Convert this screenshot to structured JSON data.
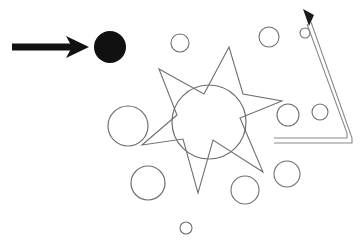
{
  "document": {
    "title": "Annotated Shapes Diagram",
    "background_color": "#ffffff",
    "width": 364,
    "height": 245
  },
  "palette": {
    "ink_black": "#111111",
    "outline_gray": "#6f6f6f",
    "outline_gray_light": "#8a8a8a",
    "background": "#ffffff"
  },
  "shapes": {
    "pointer_arrow": {
      "name": "straight-right-arrow",
      "color": "#111111",
      "shaft_start_x": 12,
      "shaft_end_x": 72,
      "shaft_y": 47,
      "shaft_thickness": 7,
      "head_tip_x": 89,
      "head_tip_y": 47,
      "head_back_x": 66,
      "head_half_height": 11
    },
    "filled_circle": {
      "name": "filled-black-circle",
      "cx": 110,
      "cy": 47,
      "r": 16,
      "fill": "#111111"
    },
    "star": {
      "name": "six-point-star-outline",
      "stroke": "#6f6f6f",
      "stroke_width": 1.1,
      "fill": "none",
      "points": "229,47 243,94 282,101 240,118 263,172 213,140 198,193 183,139 142,145 177,115 159,69 204,94"
    },
    "center_circle": {
      "name": "center-circle-outline",
      "cx": 209,
      "cy": 122,
      "r": 37,
      "stroke": "#6f6f6f",
      "stroke_width": 1.2
    },
    "bent_arrow": {
      "name": "bent-up-left-arrow",
      "stroke": "#8a8a8a",
      "stroke_width": 1.1,
      "outer_path": "M 274,143 L 352,143 L 352,138 L 311,22",
      "inner_path": "M 274,138 L 347,138 L 347,133 L 307,24",
      "head_tip_x": 303,
      "head_tip_y": 9,
      "head_color": "#1a1a1a"
    },
    "small_circles": [
      {
        "name": "circle-upper-left-mid",
        "cx": 180,
        "cy": 43,
        "r": 9
      },
      {
        "name": "circle-upper-right-mid",
        "cx": 269,
        "cy": 37,
        "r": 10
      },
      {
        "name": "circle-upper-far-right",
        "cx": 305,
        "cy": 33,
        "r": 5
      },
      {
        "name": "circle-left-large",
        "cx": 128,
        "cy": 126,
        "r": 20
      },
      {
        "name": "circle-right-mid",
        "cx": 288,
        "cy": 115,
        "r": 11
      },
      {
        "name": "circle-right-small",
        "cx": 320,
        "cy": 112,
        "r": 8
      },
      {
        "name": "circle-lower-left",
        "cx": 148,
        "cy": 183,
        "r": 17
      },
      {
        "name": "circle-lower-mid",
        "cx": 245,
        "cy": 190,
        "r": 14
      },
      {
        "name": "circle-lower-right",
        "cx": 287,
        "cy": 174,
        "r": 13
      },
      {
        "name": "circle-bottom-tiny",
        "cx": 186,
        "cy": 228,
        "r": 6
      }
    ]
  }
}
